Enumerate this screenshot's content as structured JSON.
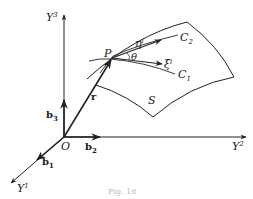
{
  "diagram": {
    "axes": {
      "y1": {
        "label": "Y",
        "sup": "1"
      },
      "y2": {
        "label": "Y",
        "sup": "2"
      },
      "y3": {
        "label": "Y",
        "sup": "3"
      }
    },
    "origin": {
      "label": "O"
    },
    "basis": {
      "b1": {
        "label": "b",
        "sub": "1"
      },
      "b2": {
        "label": "b",
        "sub": "2"
      },
      "b3": {
        "label": "b",
        "sub": "3"
      }
    },
    "position_vector": {
      "label": "r"
    },
    "point": {
      "label": "P"
    },
    "surface": {
      "label": "S"
    },
    "curves": {
      "c1": {
        "label": "C",
        "sub": "1"
      },
      "c2": {
        "label": "C",
        "sub": "2"
      }
    },
    "tangents": {
      "xi": {
        "label": "ξ",
        "sup": "i"
      },
      "eta": {
        "label": "η",
        "sup": "i"
      }
    },
    "angle": {
      "label": "θ"
    },
    "caption": "Fig. 16",
    "colors": {
      "ink": "#222222",
      "background": "#ffffff"
    }
  }
}
